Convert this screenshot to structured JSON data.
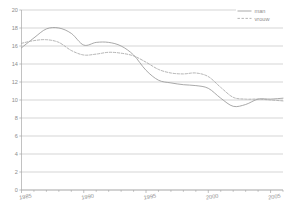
{
  "chart_data": {
    "type": "line",
    "title": "",
    "subtitle": "",
    "xlabel": "",
    "ylabel": "",
    "xlim": [
      1985,
      2006
    ],
    "ylim": [
      0,
      20
    ],
    "grid": true,
    "legend_position": "top-right",
    "x": [
      1985,
      1986,
      1987,
      1988,
      1989,
      1990,
      1991,
      1992,
      1993,
      1994,
      1995,
      1996,
      1997,
      1998,
      1999,
      2000,
      2001,
      2002,
      2003,
      2004,
      2005,
      2006
    ],
    "series": [
      {
        "name": "man",
        "style": "solid",
        "color": "#9a9a9a",
        "values": [
          15.8,
          16.9,
          17.9,
          18.0,
          17.4,
          16.1,
          16.4,
          16.4,
          16.0,
          15.0,
          13.3,
          12.2,
          11.9,
          11.7,
          11.6,
          11.3,
          10.2,
          9.3,
          9.5,
          10.1,
          10.1,
          10.2
        ]
      },
      {
        "name": "vrouw",
        "style": "dashed",
        "color": "#a6a6a6",
        "values": [
          16.3,
          16.6,
          16.7,
          16.4,
          15.5,
          15.0,
          15.1,
          15.3,
          15.2,
          14.9,
          14.2,
          13.4,
          13.0,
          12.9,
          13.0,
          12.6,
          11.4,
          10.3,
          10.1,
          10.1,
          10.0,
          9.9
        ]
      }
    ],
    "yticks": [
      0,
      2,
      4,
      6,
      8,
      10,
      12,
      14,
      16,
      18,
      20
    ],
    "ytick_labels": [
      "0",
      "2",
      "4",
      "6",
      "8",
      "10",
      "12",
      "14",
      "16",
      "18",
      "20"
    ],
    "xticks": [
      1985,
      1990,
      1995,
      2000,
      2005
    ],
    "xtick_labels": [
      "1985",
      "1990",
      "1995",
      "2000",
      "2005"
    ],
    "xtick_minor": [
      1986,
      1987,
      1988,
      1989,
      1991,
      1992,
      1993,
      1994,
      1996,
      1997,
      1998,
      1999,
      2001,
      2002,
      2003,
      2004,
      2006
    ]
  },
  "legend": {
    "items": [
      {
        "label": "man"
      },
      {
        "label": "vrouw"
      }
    ]
  }
}
